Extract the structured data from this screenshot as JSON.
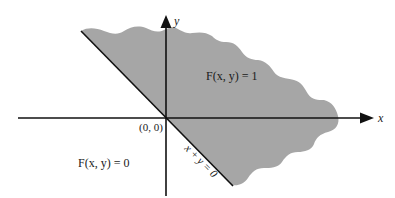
{
  "diagram": {
    "type": "region-plot",
    "axes": {
      "x_label": "x",
      "y_label": "y",
      "origin_label": "(0, 0)"
    },
    "line": {
      "label": "x + y = 0"
    },
    "regions": [
      {
        "name": "shaded",
        "label": "F(x, y) = 1",
        "color": "#a6a6a6"
      },
      {
        "name": "unshaded",
        "label": "F(x, y) = 0",
        "color": "#ffffff"
      }
    ],
    "colors": {
      "axis": "#111111",
      "shade": "#a6a6a6",
      "background": "#ffffff"
    }
  }
}
